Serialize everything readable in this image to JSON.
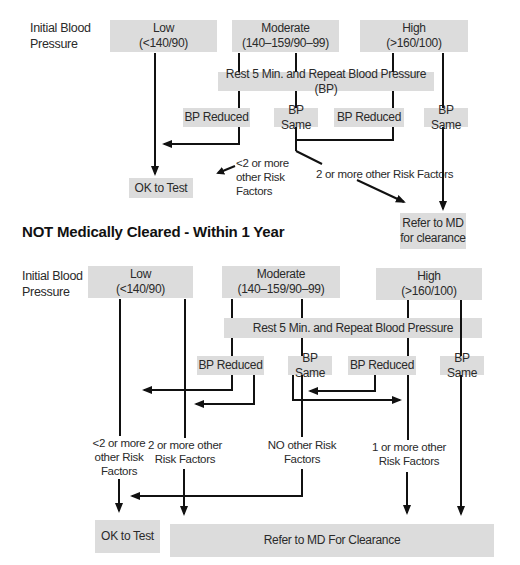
{
  "top_chart": {
    "row_label": "Initial Blood\nPressure",
    "row_label_line1": "Initial Blood",
    "row_label_line2": "Pressure",
    "low": {
      "line1": "Low",
      "line2": "(<140/90)"
    },
    "moderate": {
      "line1": "Moderate",
      "line2": "(140–159/90–99)"
    },
    "high": {
      "line1": "High",
      "line2": "(>160/100)"
    },
    "rest": "Rest 5 Min. and Repeat Blood Pressure (BP)",
    "bp_reduced_1": "BP Reduced",
    "bp_same_1": "BP Same",
    "bp_reduced_2": "BP Reduced",
    "bp_same_2": "BP Same",
    "lt2_risk": {
      "line1": "<2 or more",
      "line2": "other Risk",
      "line3": "Factors"
    },
    "ge2_risk": "2 or more other Risk Factors",
    "ok_to_test": "OK to Test",
    "refer": {
      "line1": "Refer to MD",
      "line2": "for clearance"
    }
  },
  "section_heading": "NOT Medically Cleared - Within 1 Year",
  "bottom_chart": {
    "row_label_line1": "Initial Blood",
    "row_label_line2": "Pressure",
    "low": {
      "line1": "Low",
      "line2": "(<140/90)"
    },
    "moderate": {
      "line1": "Moderate",
      "line2": "(140–159/90–99)"
    },
    "high": {
      "line1": "High",
      "line2": "(>160/100)"
    },
    "rest": "Rest 5 Min. and Repeat Blood Pressure",
    "bp_reduced_1": "BP Reduced",
    "bp_same_1": "BP Same",
    "bp_reduced_2": "BP Reduced",
    "bp_same_2": "BP Same",
    "lt2_risk": {
      "line1": "<2 or more",
      "line2": "other Risk",
      "line3": "Factors"
    },
    "ge2_risk": {
      "line1": "2 or more other",
      "line2": "Risk Factors"
    },
    "no_risk": {
      "line1": "NO other Risk",
      "line2": "Factors"
    },
    "ge1_risk": {
      "line1": "1 or more other",
      "line2": "Risk Factors"
    },
    "ok_to_test": "OK to Test",
    "refer": "Refer to MD For Clearance"
  },
  "colors": {
    "box_fill": "#dcdcdc",
    "line": "#111111"
  }
}
